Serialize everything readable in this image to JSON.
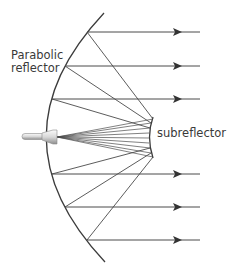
{
  "labels": {
    "parabolic_line1": "Parabolic",
    "parabolic_line2": "reflector",
    "subreflector": "subreflector"
  },
  "colors": {
    "line": "#4a4a4a",
    "arrow": "#333333",
    "text": "#3a3a3a",
    "feed_light": "#f2f2f2",
    "feed_dark": "#9a9a9a"
  },
  "diagram": {
    "type": "cassegrain-antenna",
    "components": [
      "parabolic reflector",
      "subreflector",
      "feed horn"
    ],
    "outgoing_rays": 6,
    "ray_y": [
      32,
      66,
      99,
      174,
      207,
      240
    ]
  }
}
